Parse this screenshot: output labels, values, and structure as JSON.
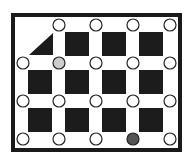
{
  "diagram": {
    "frame": {
      "x": 13,
      "y": 15,
      "width": 167,
      "height": 135,
      "stroke": "#1a1a1a",
      "stroke_width": 4
    },
    "square_color": "#1c1c1c",
    "triangle": {
      "points": "29,55 53,55 53,33",
      "color": "#1c1c1c"
    },
    "squares": [
      {
        "row": 0,
        "col": 1,
        "x": 65,
        "y": 32
      },
      {
        "row": 0,
        "col": 2,
        "x": 102,
        "y": 32
      },
      {
        "row": 0,
        "col": 3,
        "x": 139,
        "y": 32
      },
      {
        "row": 1,
        "col": 0,
        "x": 28,
        "y": 70
      },
      {
        "row": 1,
        "col": 1,
        "x": 65,
        "y": 70
      },
      {
        "row": 1,
        "col": 2,
        "x": 102,
        "y": 70
      },
      {
        "row": 1,
        "col": 3,
        "x": 139,
        "y": 70
      },
      {
        "row": 2,
        "col": 0,
        "x": 28,
        "y": 108
      },
      {
        "row": 2,
        "col": 1,
        "x": 65,
        "y": 108
      },
      {
        "row": 2,
        "col": 2,
        "x": 102,
        "y": 108
      },
      {
        "row": 2,
        "col": 3,
        "x": 139,
        "y": 108
      }
    ],
    "square_size": 24,
    "circle_radius": 6,
    "circles": [
      {
        "cx": 59,
        "cy": 25,
        "fill": "#ffffff"
      },
      {
        "cx": 96,
        "cy": 25,
        "fill": "#ffffff"
      },
      {
        "cx": 133,
        "cy": 25,
        "fill": "#ffffff"
      },
      {
        "cx": 170,
        "cy": 25,
        "fill": "#ffffff"
      },
      {
        "cx": 23,
        "cy": 63,
        "fill": "#ffffff"
      },
      {
        "cx": 59,
        "cy": 63,
        "fill": "#cccccc",
        "state": "light-gray"
      },
      {
        "cx": 96,
        "cy": 63,
        "fill": "#ffffff"
      },
      {
        "cx": 133,
        "cy": 63,
        "fill": "#ffffff"
      },
      {
        "cx": 170,
        "cy": 63,
        "fill": "#ffffff"
      },
      {
        "cx": 23,
        "cy": 101,
        "fill": "#ffffff"
      },
      {
        "cx": 59,
        "cy": 101,
        "fill": "#ffffff"
      },
      {
        "cx": 96,
        "cy": 101,
        "fill": "#ffffff"
      },
      {
        "cx": 133,
        "cy": 101,
        "fill": "#ffffff"
      },
      {
        "cx": 170,
        "cy": 101,
        "fill": "#ffffff"
      },
      {
        "cx": 23,
        "cy": 139,
        "fill": "#ffffff"
      },
      {
        "cx": 59,
        "cy": 139,
        "fill": "#ffffff"
      },
      {
        "cx": 96,
        "cy": 139,
        "fill": "#ffffff"
      },
      {
        "cx": 133,
        "cy": 139,
        "fill": "#555555",
        "state": "dark-gray"
      },
      {
        "cx": 170,
        "cy": 139,
        "fill": "#ffffff"
      }
    ]
  }
}
